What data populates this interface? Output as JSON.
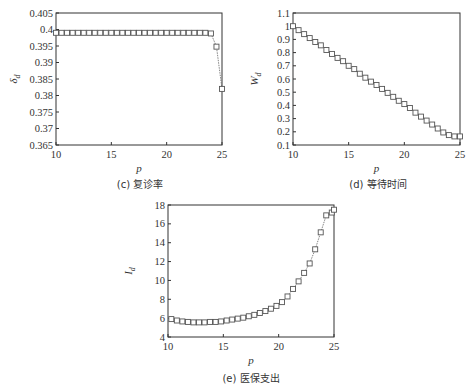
{
  "chart_data": [
    {
      "id": "c",
      "type": "line",
      "caption": "(c) 复诊率",
      "xlabel": "p",
      "ylabel": "δ_d",
      "ylabel_main": "δ",
      "ylabel_sub": "d",
      "xlim": [
        10,
        25
      ],
      "ylim": [
        0.365,
        0.405
      ],
      "xticks": [
        10,
        15,
        20,
        25
      ],
      "yticks": [
        0.365,
        0.37,
        0.375,
        0.38,
        0.385,
        0.39,
        0.395,
        0.4,
        0.405
      ],
      "ytick_labels": [
        "0.365",
        "0.37",
        "0.375",
        "0.38",
        "0.385",
        "0.39",
        "0.395",
        "0.4",
        "0.405"
      ],
      "marker": "square",
      "line_style": "dotted",
      "grid": false,
      "x": [
        10,
        10.5,
        11,
        11.5,
        12,
        12.5,
        13,
        13.5,
        14,
        14.5,
        15,
        15.5,
        16,
        16.5,
        17,
        17.5,
        18,
        18.5,
        19,
        19.5,
        20,
        20.5,
        21,
        21.5,
        22,
        22.5,
        23,
        23.5,
        24.0,
        24.5,
        25
      ],
      "values": [
        0.399,
        0.399,
        0.399,
        0.399,
        0.399,
        0.399,
        0.399,
        0.399,
        0.399,
        0.399,
        0.399,
        0.399,
        0.399,
        0.399,
        0.399,
        0.399,
        0.399,
        0.399,
        0.399,
        0.399,
        0.399,
        0.399,
        0.399,
        0.399,
        0.399,
        0.399,
        0.399,
        0.399,
        0.3988,
        0.3948,
        0.382,
        0.369
      ]
    },
    {
      "id": "d",
      "type": "line",
      "caption": "(d) 等待时间",
      "xlabel": "p",
      "ylabel": "W_d",
      "ylabel_main": "W",
      "ylabel_sub": "d",
      "xlim": [
        10,
        25
      ],
      "ylim": [
        0.1,
        1.1
      ],
      "xticks": [
        10,
        15,
        20,
        25
      ],
      "yticks": [
        0.1,
        0.2,
        0.3,
        0.4,
        0.5,
        0.6,
        0.7,
        0.8,
        0.9,
        1.0,
        1.1
      ],
      "ytick_labels": [
        "0.1",
        "0.2",
        "0.3",
        "0.4",
        "0.5",
        "0.6",
        "0.7",
        "0.8",
        "0.9",
        "1",
        "1.1"
      ],
      "marker": "square",
      "line_style": "dotted",
      "grid": false,
      "x": [
        10,
        10.5,
        11,
        11.5,
        12,
        12.5,
        13,
        13.5,
        14,
        14.5,
        15,
        15.5,
        16,
        16.5,
        17,
        17.5,
        18,
        18.5,
        19,
        19.5,
        20,
        20.5,
        21,
        21.5,
        22,
        22.5,
        23,
        23.5,
        24,
        24.5,
        25
      ],
      "values": [
        1.0,
        0.97,
        0.94,
        0.91,
        0.88,
        0.855,
        0.82,
        0.79,
        0.76,
        0.735,
        0.7,
        0.675,
        0.64,
        0.61,
        0.58,
        0.555,
        0.525,
        0.495,
        0.465,
        0.435,
        0.41,
        0.38,
        0.345,
        0.315,
        0.285,
        0.255,
        0.225,
        0.195,
        0.175,
        0.165,
        0.165
      ]
    },
    {
      "id": "e",
      "type": "line",
      "caption": "(e) 医保支出",
      "xlabel": "p",
      "ylabel": "I_d",
      "ylabel_main": "I",
      "ylabel_sub": "d",
      "xlim": [
        10,
        25
      ],
      "ylim": [
        4,
        18
      ],
      "xticks": [
        10,
        15,
        20,
        25
      ],
      "yticks": [
        4,
        6,
        8,
        10,
        12,
        14,
        16,
        18
      ],
      "ytick_labels": [
        "4",
        "6",
        "8",
        "10",
        "12",
        "14",
        "16",
        "18"
      ],
      "marker": "square",
      "line_style": "dotted",
      "grid": false,
      "x": [
        10.3,
        10.8,
        11.3,
        11.8,
        12.3,
        12.8,
        13.3,
        13.8,
        14.3,
        14.8,
        15.3,
        15.8,
        16.3,
        16.8,
        17.3,
        17.8,
        18.3,
        18.8,
        19.3,
        19.8,
        20.3,
        20.8,
        21.3,
        21.8,
        22.3,
        22.8,
        23.3,
        23.8,
        24.3,
        24.8,
        25
      ],
      "values": [
        5.9,
        5.75,
        5.65,
        5.6,
        5.55,
        5.55,
        5.55,
        5.6,
        5.6,
        5.65,
        5.75,
        5.85,
        5.95,
        6.05,
        6.2,
        6.35,
        6.55,
        6.75,
        7.0,
        7.3,
        7.7,
        8.3,
        9.1,
        9.9,
        10.8,
        11.8,
        13.3,
        15.1,
        16.9,
        17.2,
        17.5
      ]
    }
  ],
  "panels": {
    "c": {
      "caption": "(c) 复诊率",
      "xlabel": "p"
    },
    "d": {
      "caption": "(d) 等待时间",
      "xlabel": "p"
    },
    "e": {
      "caption": "(e) 医保支出",
      "xlabel": "p"
    }
  },
  "colors": {
    "axis": "#333333",
    "marker_stroke": "#555555",
    "line": "#666666",
    "background": "#ffffff"
  }
}
